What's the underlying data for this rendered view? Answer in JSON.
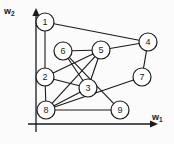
{
  "figure": {
    "title": "",
    "background": "#fbfbfb",
    "width": 174,
    "height": 144,
    "stroke_color": "#1a1a1a",
    "node_fill": "#ffffff"
  },
  "axes": {
    "x": {
      "label_main": "w",
      "label_sub": "1",
      "arrow": true,
      "x1": 28,
      "y1": 124,
      "x2": 150,
      "y2": 124
    },
    "y": {
      "label_main": "w",
      "label_sub": "2",
      "arrow": true,
      "x1": 36,
      "y1": 132,
      "x2": 36,
      "y2": 16
    }
  },
  "chart_data": {
    "type": "scatter",
    "title": "",
    "xlabel": "w1",
    "ylabel": "w2",
    "nodes": [
      {
        "id": "1",
        "label": "1",
        "x": 45,
        "y": 22,
        "r": 9
      },
      {
        "id": "2",
        "label": "2",
        "x": 45,
        "y": 77,
        "r": 9
      },
      {
        "id": "3",
        "label": "3",
        "x": 88,
        "y": 88,
        "r": 9
      },
      {
        "id": "4",
        "label": "4",
        "x": 148,
        "y": 42,
        "r": 9
      },
      {
        "id": "5",
        "label": "5",
        "x": 101,
        "y": 50,
        "r": 9
      },
      {
        "id": "6",
        "label": "6",
        "x": 63,
        "y": 51,
        "r": 9
      },
      {
        "id": "7",
        "label": "7",
        "x": 142,
        "y": 77,
        "r": 9
      },
      {
        "id": "8",
        "label": "8",
        "x": 46,
        "y": 110,
        "r": 9
      },
      {
        "id": "9",
        "label": "9",
        "x": 120,
        "y": 110,
        "r": 9
      }
    ],
    "edges": [
      {
        "from": "1",
        "to": "4"
      },
      {
        "from": "1",
        "to": "2"
      },
      {
        "from": "2",
        "to": "8"
      },
      {
        "from": "2",
        "to": "5"
      },
      {
        "from": "2",
        "to": "3"
      },
      {
        "from": "6",
        "to": "5"
      },
      {
        "from": "6",
        "to": "3"
      },
      {
        "from": "6",
        "to": "9"
      },
      {
        "from": "5",
        "to": "4"
      },
      {
        "from": "5",
        "to": "3"
      },
      {
        "from": "5",
        "to": "8"
      },
      {
        "from": "4",
        "to": "7"
      },
      {
        "from": "7",
        "to": "8"
      },
      {
        "from": "8",
        "to": "3"
      },
      {
        "from": "8",
        "to": "9"
      }
    ]
  }
}
